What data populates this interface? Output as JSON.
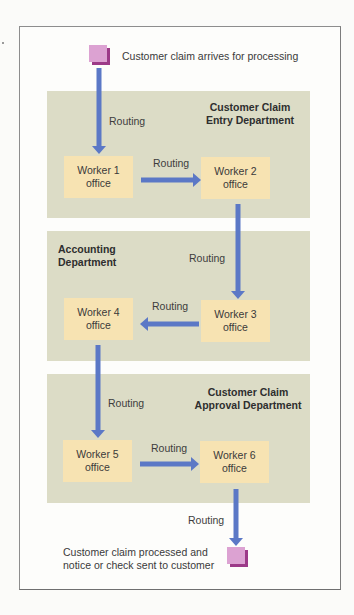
{
  "diagram": {
    "start": {
      "caption": "Customer claim arrives for processing",
      "icon": "document-square-icon"
    },
    "end": {
      "caption": "Customer claim processed and\nnotice or check sent to customer",
      "icon": "document-square-icon"
    },
    "departments": [
      {
        "name": "Customer Claim\nEntry Department",
        "workers": [
          "Worker 1\noffice",
          "Worker 2\noffice"
        ]
      },
      {
        "name": "Accounting\nDepartment",
        "workers": [
          "Worker 4\noffice",
          "Worker 3\noffice"
        ]
      },
      {
        "name": "Customer Claim\nApproval Department",
        "workers": [
          "Worker 5\noffice",
          "Worker 6\noffice"
        ]
      }
    ],
    "routing_label": "Routing",
    "routes": [
      {
        "from": "Customer claim arrives",
        "to": "Worker 1 office",
        "label": "Routing"
      },
      {
        "from": "Worker 1 office",
        "to": "Worker 2 office",
        "label": "Routing"
      },
      {
        "from": "Worker 2 office",
        "to": "Worker 3 office",
        "label": "Routing"
      },
      {
        "from": "Worker 3 office",
        "to": "Worker 4 office",
        "label": "Routing"
      },
      {
        "from": "Worker 4 office",
        "to": "Worker 5 office",
        "label": "Routing"
      },
      {
        "from": "Worker 5 office",
        "to": "Worker 6 office",
        "label": "Routing"
      },
      {
        "from": "Worker 6 office",
        "to": "Customer claim processed",
        "label": "Routing"
      }
    ],
    "colors": {
      "department_band": "#dcdcc6",
      "worker_box": "#f7e3b2",
      "arrow": "#5b78c6",
      "document": "#dca2d2",
      "document_shadow": "#9c3a88",
      "frame_border": "#8d8d8d"
    }
  }
}
